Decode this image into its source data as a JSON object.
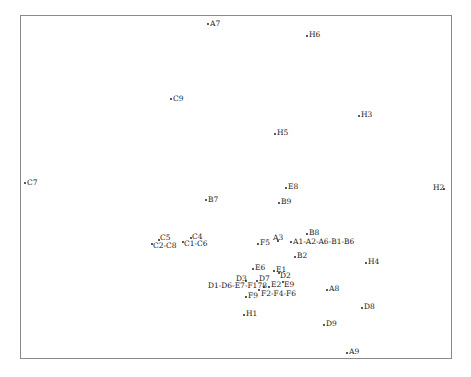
{
  "chart_data": {
    "type": "scatter",
    "title": "",
    "xlabel": "",
    "ylabel": "",
    "grid": false,
    "legend": null,
    "frame_px": {
      "left": 20,
      "top": 15,
      "right": 452,
      "bottom": 359
    },
    "points": [
      {
        "label": "A7",
        "dx": 208,
        "dy": 24,
        "lx": 210,
        "ly": 20,
        "anchor": "left"
      },
      {
        "label": "H6",
        "dx": 307,
        "dy": 36,
        "lx": 309,
        "ly": 31,
        "anchor": "left"
      },
      {
        "label": "C9",
        "dx": 171,
        "dy": 99,
        "lx": 173,
        "ly": 95,
        "anchor": "left"
      },
      {
        "label": "H3",
        "dx": 359,
        "dy": 116,
        "lx": 361,
        "ly": 111,
        "anchor": "left"
      },
      {
        "label": "H5",
        "dx": 275,
        "dy": 134,
        "lx": 277,
        "ly": 129,
        "anchor": "left"
      },
      {
        "label": "C7",
        "dx": 25,
        "dy": 183,
        "lx": 27,
        "ly": 179,
        "anchor": "left"
      },
      {
        "label": "E8",
        "dx": 286,
        "dy": 188,
        "lx": 288,
        "ly": 183,
        "anchor": "left"
      },
      {
        "label": "H2",
        "dx": 444,
        "dy": 189,
        "lx": 433,
        "ly": 184,
        "anchor": "right"
      },
      {
        "label": "B7",
        "dx": 206,
        "dy": 200,
        "lx": 208,
        "ly": 196,
        "anchor": "left"
      },
      {
        "label": "B9",
        "dx": 279,
        "dy": 203,
        "lx": 281,
        "ly": 198,
        "anchor": "left"
      },
      {
        "label": "B8",
        "dx": 307,
        "dy": 234,
        "lx": 309,
        "ly": 229,
        "anchor": "left"
      },
      {
        "label": "C5",
        "dx": 159,
        "dy": 240,
        "lx": 160,
        "ly": 234,
        "anchor": "left"
      },
      {
        "label": "C4",
        "dx": 191,
        "dy": 238,
        "lx": 192,
        "ly": 233,
        "anchor": "left"
      },
      {
        "label": "A3",
        "dx": 278,
        "dy": 241,
        "lx": 273,
        "ly": 234,
        "anchor": "left"
      },
      {
        "label": "A1-A2-A6-B1-B6",
        "dx": 291,
        "dy": 242,
        "lx": 293,
        "ly": 238,
        "anchor": "left"
      },
      {
        "label": "F5",
        "dx": 258,
        "dy": 244,
        "lx": 260,
        "ly": 239,
        "anchor": "left"
      },
      {
        "label": "C2-C8",
        "dx": 152,
        "dy": 244,
        "lx": 153,
        "ly": 242,
        "anchor": "left"
      },
      {
        "label": "C1-C6",
        "dx": 183,
        "dy": 242,
        "lx": 184,
        "ly": 240,
        "anchor": "left"
      },
      {
        "label": "B2",
        "dx": 295,
        "dy": 257,
        "lx": 297,
        "ly": 252,
        "anchor": "left"
      },
      {
        "label": "H4",
        "dx": 366,
        "dy": 263,
        "lx": 368,
        "ly": 258,
        "anchor": "left"
      },
      {
        "label": "E6",
        "dx": 253,
        "dy": 269,
        "lx": 255,
        "ly": 264,
        "anchor": "left"
      },
      {
        "label": "E1",
        "dx": 274,
        "dy": 271,
        "lx": 276,
        "ly": 266,
        "anchor": "left"
      },
      {
        "label": "D2",
        "dx": 279,
        "dy": 273,
        "lx": 280,
        "ly": 272,
        "anchor": "left"
      },
      {
        "label": "D3",
        "dx": 246,
        "dy": 281,
        "lx": 236,
        "ly": 275,
        "anchor": "right"
      },
      {
        "label": "D7",
        "dx": 257,
        "dy": 281,
        "lx": 259,
        "ly": 275,
        "anchor": "left"
      },
      {
        "label": "E9",
        "dx": 283,
        "dy": 282,
        "lx": 284,
        "ly": 281,
        "anchor": "left"
      },
      {
        "label": "E2",
        "dx": 269,
        "dy": 287,
        "lx": 271,
        "ly": 281,
        "anchor": "left"
      },
      {
        "label": "D1-D6-E7-F178",
        "dx": 264,
        "dy": 287,
        "lx": 208,
        "ly": 282,
        "anchor": "right"
      },
      {
        "label": "A8",
        "dx": 327,
        "dy": 290,
        "lx": 329,
        "ly": 285,
        "anchor": "left"
      },
      {
        "label": "F2-F4-F6",
        "dx": 259,
        "dy": 290,
        "lx": 261,
        "ly": 290,
        "anchor": "left"
      },
      {
        "label": "F9",
        "dx": 246,
        "dy": 297,
        "lx": 248,
        "ly": 292,
        "anchor": "left"
      },
      {
        "label": "D8",
        "dx": 362,
        "dy": 308,
        "lx": 364,
        "ly": 303,
        "anchor": "left"
      },
      {
        "label": "H1",
        "dx": 244,
        "dy": 315,
        "lx": 246,
        "ly": 310,
        "anchor": "left"
      },
      {
        "label": "D9",
        "dx": 324,
        "dy": 325,
        "lx": 326,
        "ly": 320,
        "anchor": "left"
      },
      {
        "label": "A9",
        "dx": 347,
        "dy": 353,
        "lx": 349,
        "ly": 348,
        "anchor": "left"
      }
    ]
  }
}
